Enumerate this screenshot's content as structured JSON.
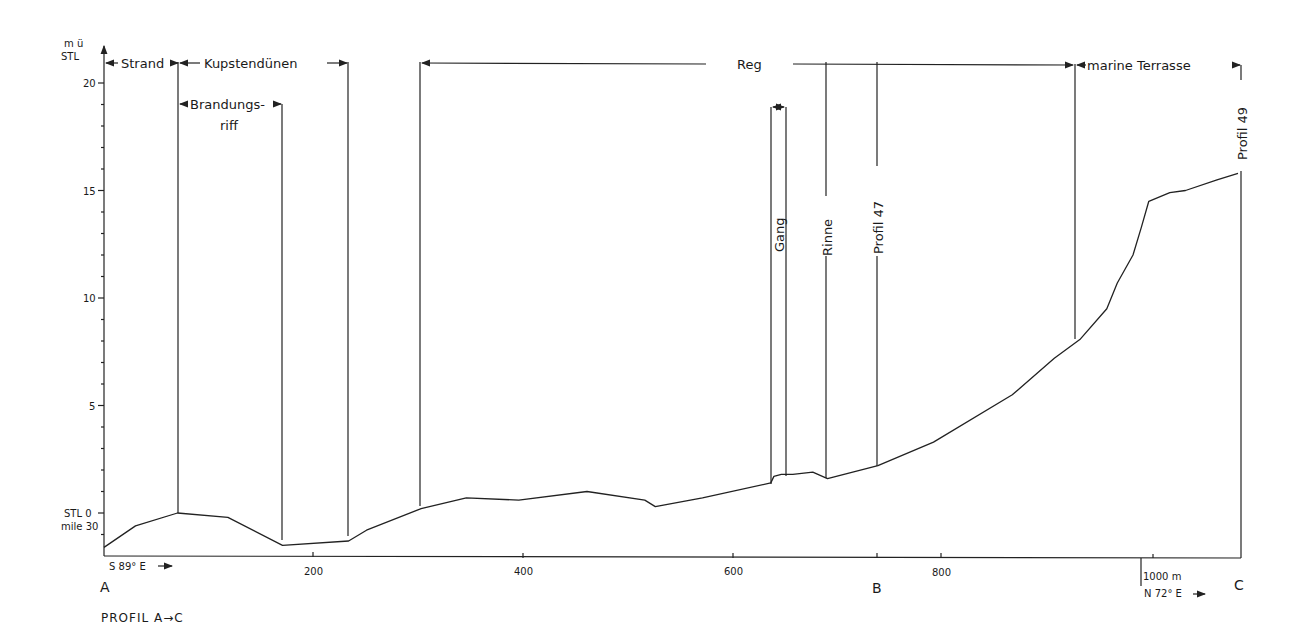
{
  "chart_data": {
    "type": "line",
    "title": "PROFIL A→C",
    "xlabel": "m",
    "ylabel": "m ü STL",
    "xlim": [
      0,
      1080
    ],
    "ylim": [
      -2,
      21
    ],
    "grid": false,
    "x_ticks": [
      200,
      400,
      600,
      800,
      1000
    ],
    "x_tick_labels": [
      "200",
      "400",
      "600",
      "800",
      "1000 m"
    ],
    "y_ticks": [
      0,
      5,
      10,
      15,
      20
    ],
    "y_tick_labels": [
      "STL 0",
      "5",
      "10",
      "15",
      "20"
    ],
    "y_zero_sublabel": "mile 30",
    "y_axis_label_lines": [
      "m ü",
      "STL"
    ],
    "direction_labels": [
      {
        "text": "S 89° E →",
        "position": "start"
      },
      {
        "text": "N 72° E →",
        "position": "after 1000 m"
      }
    ],
    "point_labels": [
      {
        "text": "A",
        "x": 0
      },
      {
        "text": "B",
        "x": 735
      },
      {
        "text": "C",
        "x": 1080
      }
    ],
    "profile": {
      "x": [
        0,
        30,
        70,
        118,
        170,
        233,
        250,
        302,
        345,
        395,
        460,
        515,
        525,
        570,
        635,
        638,
        645,
        656,
        675,
        689,
        737,
        790,
        865,
        905,
        930,
        955,
        965,
        980,
        988,
        995,
        1015,
        1030,
        1060,
        1080
      ],
      "y": [
        -1.6,
        -0.6,
        0.0,
        -0.2,
        -1.5,
        -1.3,
        -0.8,
        0.2,
        0.7,
        0.6,
        1.0,
        0.6,
        0.3,
        0.7,
        1.4,
        1.7,
        1.8,
        1.8,
        1.9,
        1.6,
        2.2,
        3.3,
        5.5,
        7.2,
        8.1,
        9.5,
        10.7,
        12.0,
        13.3,
        14.5,
        14.9,
        15.0,
        15.5,
        15.8
      ]
    },
    "zones": [
      {
        "name": "Strand",
        "x_start": 0,
        "x_end": 70
      },
      {
        "name": "Kupstendünen",
        "x_start": 70,
        "x_end": 233
      },
      {
        "name": "Brandungs-riff",
        "x_start": 70,
        "x_end": 170
      },
      {
        "name": "Reg",
        "x_start": 302,
        "x_end": 930
      },
      {
        "name": "marine Terrasse",
        "x_start": 930,
        "x_end": 1080
      }
    ],
    "vertical_markers": [
      {
        "name": "Gang",
        "x_start": 638,
        "x_end": 652
      },
      {
        "name": "Rinne",
        "x": 689
      },
      {
        "name": "Profil 47",
        "x": 737
      },
      {
        "name": "Profil 49",
        "x": 1080
      }
    ]
  },
  "labels": {
    "y_axis_top": "m ü",
    "y_axis_bottom": "STL",
    "strand": "Strand",
    "kupstendunen": "Kupstendünen",
    "brandungs": "Brandungs-",
    "riff": "riff",
    "reg": "Reg",
    "marine_terrasse": "marine Terrasse",
    "gang": "Gang",
    "rinne": "Rinne",
    "profil47": "Profil  47",
    "profil49": "Profil  49",
    "y20": "20",
    "y15": "15",
    "y10": "10",
    "y5": "5",
    "y0": "STL 0",
    "y0_sub": "mile 30",
    "x200": "200",
    "x400": "400",
    "x600": "600",
    "x800": "800",
    "x1000": "1000  m",
    "dir_start": "S 89° E",
    "dir_end": "N 72° E",
    "point_a": "A",
    "point_b": "B",
    "point_c": "C",
    "title": "PROFIL  A→C"
  }
}
